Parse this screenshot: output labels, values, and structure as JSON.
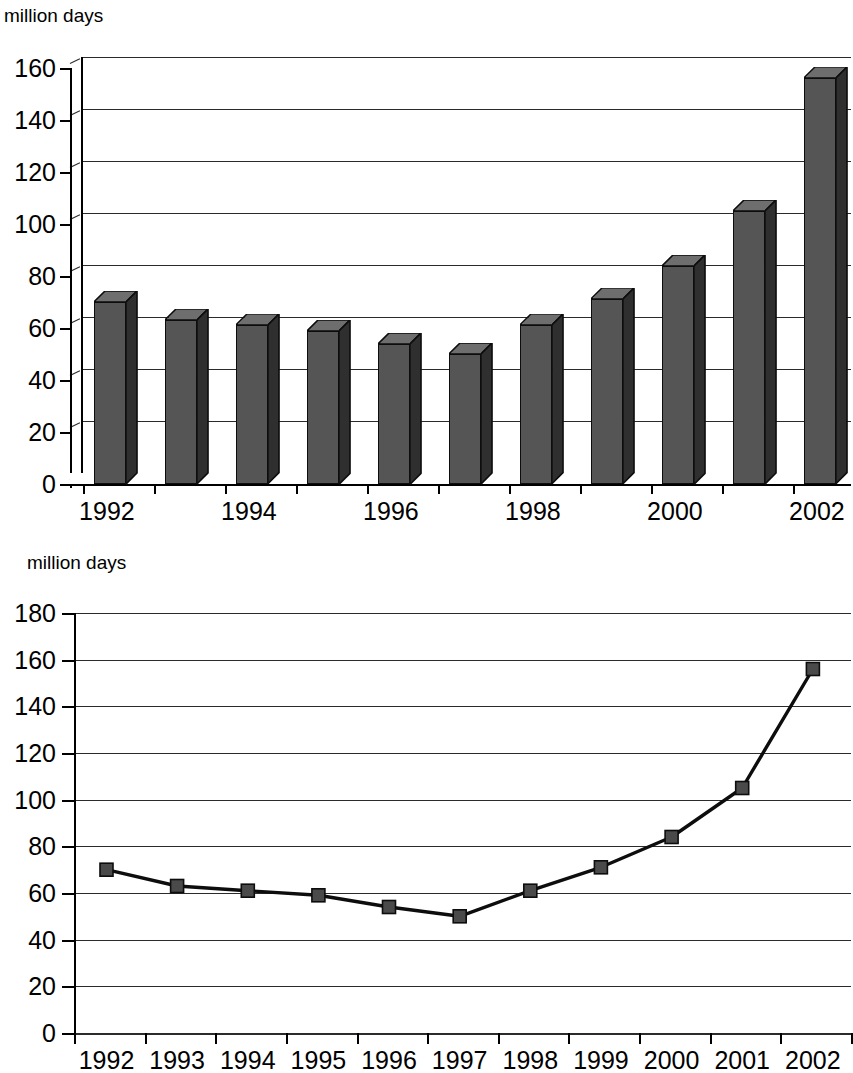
{
  "page": {
    "background": "#ffffff",
    "series_color": "#555555",
    "axis_color": "#000000",
    "grid_color": "#2b2b2b"
  },
  "top_chart": {
    "axis_title": "million days",
    "y_ticks": [
      "160",
      "140",
      "120",
      "100",
      "80",
      "60",
      "40",
      "20",
      "0"
    ],
    "x_labels": [
      "1992",
      "1994",
      "1996",
      "1998",
      "2000",
      "2002"
    ]
  },
  "bottom_chart": {
    "axis_title": "million days",
    "y_ticks": [
      "180",
      "160",
      "140",
      "120",
      "100",
      "80",
      "60",
      "40",
      "20",
      "0"
    ],
    "x_labels": [
      "1992",
      "1993",
      "1994",
      "1995",
      "1996",
      "1997",
      "1998",
      "1999",
      "2000",
      "2001",
      "2002"
    ]
  },
  "chart_data": [
    {
      "type": "bar",
      "title": "",
      "xlabel": "",
      "ylabel": "million days",
      "ylim": [
        0,
        160
      ],
      "ytick_step": 20,
      "grid": true,
      "legend": "none",
      "style": "3d-column",
      "categories": [
        "1992",
        "1993",
        "1994",
        "1995",
        "1996",
        "1997",
        "1998",
        "1999",
        "2000",
        "2001",
        "2002"
      ],
      "labeled_categories": [
        "1992",
        "1994",
        "1996",
        "1998",
        "2000",
        "2002"
      ],
      "values": [
        70,
        63,
        61,
        59,
        54,
        50,
        61,
        71,
        84,
        105,
        156
      ]
    },
    {
      "type": "line",
      "title": "",
      "xlabel": "",
      "ylabel": "million days",
      "ylim": [
        0,
        180
      ],
      "ytick_step": 20,
      "grid": true,
      "legend": "none",
      "marker": "square",
      "x": [
        "1992",
        "1993",
        "1994",
        "1995",
        "1996",
        "1997",
        "1998",
        "1999",
        "2000",
        "2001",
        "2002"
      ],
      "values": [
        70,
        63,
        61,
        59,
        54,
        50,
        61,
        71,
        84,
        105,
        156
      ]
    }
  ]
}
